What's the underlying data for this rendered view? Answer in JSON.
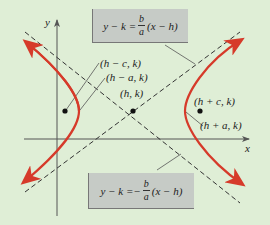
{
  "diagram": {
    "type": "hyperbola-horizontal-transverse-axis",
    "background_color": "#dfeed6",
    "curve_color": "#d63a2a",
    "axis_color": "#555555",
    "asymptote_style": "dashed",
    "axes": {
      "x_label": "x",
      "y_label": "y"
    },
    "points": {
      "center": "(h, k)",
      "left_focus": "(h − c, k)",
      "left_vertex": "(h − a, k)",
      "right_focus": "(h + c, k)",
      "right_vertex": "(h + a, k)"
    },
    "asymptote_equations": {
      "positive": {
        "lhs": "y − k = ",
        "sign": "",
        "num": "b",
        "den": "a",
        "rhs": "(x − h)"
      },
      "negative": {
        "lhs": "y − k = ",
        "sign": "−",
        "num": "b",
        "den": "a",
        "rhs": "(x − h)"
      }
    }
  }
}
